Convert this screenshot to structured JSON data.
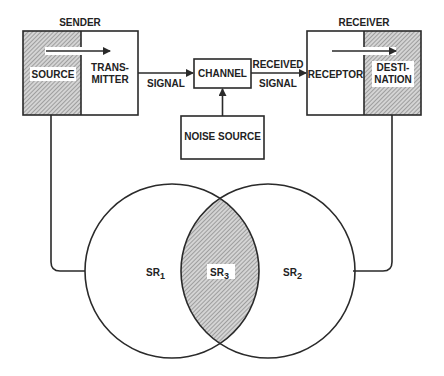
{
  "diagram": {
    "type": "communication-model",
    "sender": {
      "title": "SENDER",
      "source_label": "SOURCE",
      "transmitter_label_line1": "TRANS-",
      "transmitter_label_line2": "MITTER"
    },
    "receiver": {
      "title": "RECEIVER",
      "receptor_label": "RECEPTOR",
      "destination_label_line1": "DESTI-",
      "destination_label_line2": "NATION"
    },
    "channel": {
      "label": "CHANNEL"
    },
    "noise": {
      "label": "NOISE SOURCE"
    },
    "edges": {
      "signal_label": "SIGNAL",
      "received_signal_line1": "RECEIVED",
      "received_signal_line2": "SIGNAL"
    },
    "venn": {
      "left": {
        "label": "SR",
        "subscript": "1"
      },
      "right": {
        "label": "SR",
        "subscript": "2"
      },
      "overlap": {
        "label": "SR",
        "subscript": "3"
      }
    },
    "colors": {
      "line": "#2a2a2a",
      "hatch_bg": "#cfcfcf",
      "hatch_line": "#7a7a7a",
      "background": "#ffffff"
    }
  }
}
